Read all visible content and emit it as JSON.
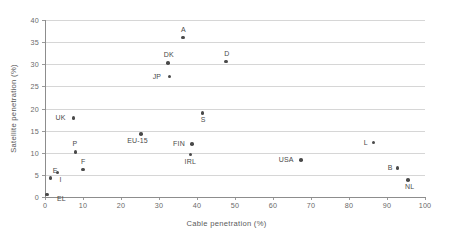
{
  "chart_data": {
    "type": "scatter",
    "title": "",
    "xlabel": "Cable penetration (%)",
    "ylabel": "Satellite penetration (%)",
    "xlim": [
      0,
      100
    ],
    "ylim": [
      0,
      40
    ],
    "xticks": [
      "0",
      "10",
      "20",
      "30",
      "40",
      "50",
      "60",
      "70",
      "80",
      "90",
      "100"
    ],
    "yticks": [
      "0",
      "5",
      "10",
      "15",
      "20",
      "25",
      "30",
      "35",
      "40"
    ],
    "grid": "horizontal",
    "legend": "none",
    "marker_color": "#4a4a4a",
    "grid_color": "#d6d6d6",
    "axis_color": "#8d8d8d",
    "points": [
      {
        "label": "EL",
        "x": 0.5,
        "y": 0.6,
        "lx": 10,
        "ly": 1
      },
      {
        "label": "E",
        "x": 1.5,
        "y": 4.3,
        "lx": 2,
        "ly": -11
      },
      {
        "label": "I",
        "x": 3.3,
        "y": 5.5,
        "lx": 2,
        "ly": 3
      },
      {
        "label": "UK",
        "x": 7.5,
        "y": 17.8,
        "lx": -18,
        "ly": -4
      },
      {
        "label": "P",
        "x": 8.0,
        "y": 10.2,
        "lx": -3,
        "ly": -12
      },
      {
        "label": "F",
        "x": 10.0,
        "y": 6.2,
        "lx": -2,
        "ly": -12
      },
      {
        "label": "EU-15",
        "x": 25.3,
        "y": 14.3,
        "lx": -14,
        "ly": 3
      },
      {
        "label": "DK",
        "x": 32.3,
        "y": 30.3,
        "lx": -4,
        "ly": -12
      },
      {
        "label": "JP",
        "x": 32.8,
        "y": 27.2,
        "lx": -17,
        "ly": -4
      },
      {
        "label": "A",
        "x": 36.3,
        "y": 36.0,
        "lx": -2,
        "ly": -12
      },
      {
        "label": "IRL",
        "x": 38.3,
        "y": 9.6,
        "lx": -6,
        "ly": 3
      },
      {
        "label": "FIN",
        "x": 38.7,
        "y": 12.0,
        "lx": -19,
        "ly": -4
      },
      {
        "label": "S",
        "x": 41.5,
        "y": 19.0,
        "lx": -2,
        "ly": 3
      },
      {
        "label": "D",
        "x": 47.7,
        "y": 30.6,
        "lx": -2,
        "ly": -12
      },
      {
        "label": "USA",
        "x": 67.3,
        "y": 8.3,
        "lx": -22,
        "ly": -4
      },
      {
        "label": "L",
        "x": 86.5,
        "y": 12.3,
        "lx": -10,
        "ly": -4
      },
      {
        "label": "B",
        "x": 92.8,
        "y": 6.6,
        "lx": -10,
        "ly": -4
      },
      {
        "label": "NL",
        "x": 95.5,
        "y": 3.9,
        "lx": -3,
        "ly": 3
      }
    ]
  }
}
